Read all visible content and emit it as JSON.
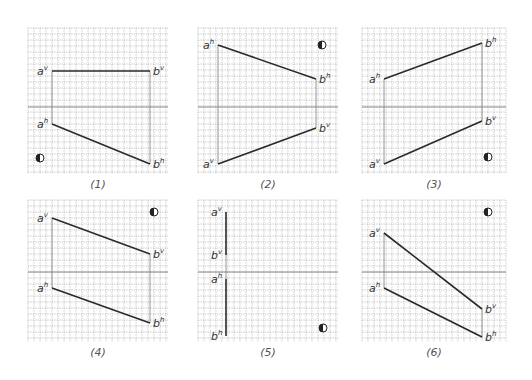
{
  "colors": {
    "grid": "#9a9a9a",
    "axis": "#8a8a8a",
    "line": "#2a2a2a",
    "projector": "#8a8a8a",
    "label": "#333333"
  },
  "grid": {
    "cols": 24,
    "rows": 24,
    "cell": 6
  },
  "panels": [
    {
      "id": 1,
      "caption": "(1)",
      "x": 28,
      "y": 28,
      "w": 140,
      "h": 146,
      "axisY": 79,
      "points": {
        "av": {
          "x": 24,
          "y": 43,
          "label": "a",
          "sup": "v"
        },
        "bv": {
          "x": 122,
          "y": 43,
          "label": "b",
          "sup": "v"
        },
        "ah": {
          "x": 24,
          "y": 96,
          "label": "a",
          "sup": "h"
        },
        "bh": {
          "x": 122,
          "y": 136,
          "label": "b",
          "sup": "h"
        }
      },
      "segments": [
        [
          "av",
          "bv"
        ],
        [
          "ah",
          "bh"
        ]
      ],
      "projectors": [
        [
          "av",
          "ah"
        ],
        [
          "bv",
          "bh"
        ]
      ],
      "quadrant_symbol": {
        "x": 12,
        "y": 130
      }
    },
    {
      "id": 2,
      "caption": "(2)",
      "x": 198,
      "y": 28,
      "w": 140,
      "h": 146,
      "axisY": 79,
      "points": {
        "ah": {
          "x": 20,
          "y": 17,
          "label": "a",
          "sup": "h"
        },
        "bh": {
          "x": 118,
          "y": 51,
          "label": "b",
          "sup": "h"
        },
        "bv": {
          "x": 118,
          "y": 100,
          "label": "b",
          "sup": "v"
        },
        "av": {
          "x": 20,
          "y": 136,
          "label": "a",
          "sup": "v"
        }
      },
      "segments": [
        [
          "ah",
          "bh"
        ],
        [
          "av",
          "bv"
        ]
      ],
      "projectors": [
        [
          "ah",
          "av"
        ],
        [
          "bh",
          "bv"
        ]
      ],
      "quadrant_symbol": {
        "x": 124,
        "y": 17
      }
    },
    {
      "id": 3,
      "caption": "(3)",
      "x": 362,
      "y": 28,
      "w": 144,
      "h": 146,
      "axisY": 79,
      "points": {
        "bh": {
          "x": 120,
          "y": 15,
          "label": "b",
          "sup": "h"
        },
        "ah": {
          "x": 22,
          "y": 51,
          "label": "a",
          "sup": "h"
        },
        "bv": {
          "x": 120,
          "y": 93,
          "label": "b",
          "sup": "v"
        },
        "av": {
          "x": 22,
          "y": 136,
          "label": "a",
          "sup": "v"
        }
      },
      "segments": [
        [
          "ah",
          "bh"
        ],
        [
          "av",
          "bv"
        ]
      ],
      "projectors": [
        [
          "ah",
          "av"
        ],
        [
          "bh",
          "bv"
        ]
      ],
      "quadrant_symbol": {
        "x": 126,
        "y": 129
      }
    },
    {
      "id": 4,
      "caption": "(4)",
      "x": 28,
      "y": 200,
      "w": 140,
      "h": 142,
      "axisY": 72,
      "points": {
        "av": {
          "x": 24,
          "y": 18,
          "label": "a",
          "sup": "v"
        },
        "bv": {
          "x": 122,
          "y": 54,
          "label": "b",
          "sup": "v"
        },
        "ah": {
          "x": 24,
          "y": 88,
          "label": "a",
          "sup": "h"
        },
        "bh": {
          "x": 122,
          "y": 123,
          "label": "b",
          "sup": "h"
        }
      },
      "segments": [
        [
          "av",
          "bv"
        ],
        [
          "ah",
          "bh"
        ]
      ],
      "projectors": [
        [
          "av",
          "ah"
        ],
        [
          "bv",
          "bh"
        ]
      ],
      "quadrant_symbol": {
        "x": 126,
        "y": 12
      }
    },
    {
      "id": 5,
      "caption": "(5)",
      "x": 198,
      "y": 200,
      "w": 140,
      "h": 142,
      "axisY": 72,
      "points": {
        "av": {
          "x": 28,
          "y": 12,
          "label": "a",
          "sup": "v"
        },
        "bv": {
          "x": 28,
          "y": 55,
          "label": "b",
          "sup": "v"
        },
        "ah": {
          "x": 28,
          "y": 79,
          "label": "a",
          "sup": "h"
        },
        "bh": {
          "x": 28,
          "y": 136,
          "label": "b",
          "sup": "h"
        }
      },
      "segments": [
        [
          "av",
          "bv"
        ],
        [
          "ah",
          "bh"
        ]
      ],
      "projectors": [
        [
          "bv",
          "ah"
        ]
      ],
      "quadrant_symbol": {
        "x": 125,
        "y": 128
      }
    },
    {
      "id": 6,
      "caption": "(6)",
      "x": 362,
      "y": 200,
      "w": 144,
      "h": 142,
      "axisY": 72,
      "points": {
        "av": {
          "x": 22,
          "y": 33,
          "label": "a",
          "sup": "v"
        },
        "ah": {
          "x": 22,
          "y": 88,
          "label": "a",
          "sup": "h"
        },
        "bv": {
          "x": 120,
          "y": 109,
          "label": "b",
          "sup": "v"
        },
        "bh": {
          "x": 120,
          "y": 137,
          "label": "b",
          "sup": "h"
        }
      },
      "segments": [
        [
          "av",
          "bv"
        ],
        [
          "ah",
          "bh"
        ]
      ],
      "projectors": [
        [
          "av",
          "ah"
        ],
        [
          "bv",
          "bh"
        ]
      ],
      "quadrant_symbol": {
        "x": 126,
        "y": 12
      }
    }
  ]
}
